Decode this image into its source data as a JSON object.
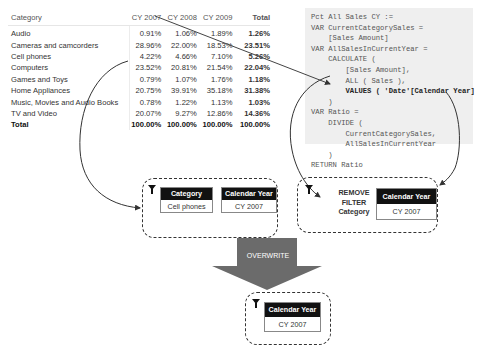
{
  "matrix": {
    "columns": [
      "Category",
      "CY 2007",
      "CY 2008",
      "CY 2009",
      "Total"
    ],
    "rows": [
      {
        "category": "Audio",
        "cy2007": "0.91%",
        "cy2008": "1.06%",
        "cy2009": "1.89%",
        "total": "1.26%"
      },
      {
        "category": "Cameras and camcorders",
        "cy2007": "28.96%",
        "cy2008": "22.00%",
        "cy2009": "18.53%",
        "total": "23.51%"
      },
      {
        "category": "Cell phones",
        "cy2007": "4.22%",
        "cy2008": "4.66%",
        "cy2009": "7.10%",
        "total": "5.26%"
      },
      {
        "category": "Computers",
        "cy2007": "23.52%",
        "cy2008": "20.81%",
        "cy2009": "21.54%",
        "total": "22.04%"
      },
      {
        "category": "Games and Toys",
        "cy2007": "0.79%",
        "cy2008": "1.07%",
        "cy2009": "1.76%",
        "total": "1.18%"
      },
      {
        "category": "Home Appliances",
        "cy2007": "20.75%",
        "cy2008": "39.91%",
        "cy2009": "35.18%",
        "total": "31.38%"
      },
      {
        "category": "Music, Movies and Audio Books",
        "cy2007": "0.78%",
        "cy2008": "1.22%",
        "cy2009": "1.13%",
        "total": "1.03%"
      },
      {
        "category": "TV and Video",
        "cy2007": "20.07%",
        "cy2008": "9.27%",
        "cy2009": "12.86%",
        "total": "14.36%"
      }
    ],
    "total_row": {
      "category": "Total",
      "cy2007": "100.00%",
      "cy2008": "100.00%",
      "cy2009": "100.00%",
      "total": "100.00%"
    }
  },
  "code": {
    "lines": [
      "Pct All Sales CY :=",
      "VAR CurrentCategorySales =",
      "    [Sales Amount]",
      "VAR AllSalesInCurrentYear =",
      "    CALCULATE (",
      "        [Sales Amount],",
      "        ALL ( Sales ),",
      "        VALUES ( 'Date'[Calendar Year] )",
      "    )",
      "VAR Ratio =",
      "    DIVIDE (",
      "        CurrentCategorySales,",
      "        AllSalesInCurrentYear",
      "    )",
      "RETURN Ratio"
    ]
  },
  "filters": {
    "original": {
      "category_header": "Category",
      "category_value": "Cell phones",
      "year_header": "Calendar Year",
      "year_value": "CY 2007"
    },
    "calculate": {
      "remove_line1": "REMOVE",
      "remove_line2": "FILTER",
      "remove_line3": "Category",
      "year_header": "Calendar Year",
      "year_value": "CY 2007"
    },
    "result": {
      "year_header": "Calendar Year",
      "year_value": "CY 2007"
    }
  },
  "arrow": {
    "label": "OVERWRITE",
    "color": "#6b6b6b"
  }
}
